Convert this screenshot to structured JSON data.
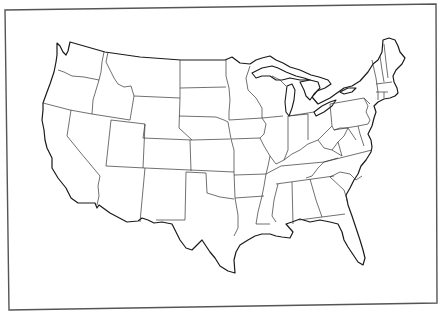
{
  "map": {
    "title": "Blank outline map of the contiguous United States",
    "style": "outline",
    "colors": {
      "background": "#ffffff",
      "outline": "#1a1a1a",
      "state_border": "#333333",
      "frame": "#555555"
    },
    "states": [
      "Washington",
      "Oregon",
      "California",
      "Idaho",
      "Nevada",
      "Montana",
      "Wyoming",
      "Utah",
      "Arizona",
      "Colorado",
      "New Mexico",
      "North Dakota",
      "South Dakota",
      "Nebraska",
      "Kansas",
      "Oklahoma",
      "Texas",
      "Minnesota",
      "Iowa",
      "Missouri",
      "Arkansas",
      "Louisiana",
      "Wisconsin",
      "Illinois",
      "Michigan",
      "Indiana",
      "Ohio",
      "Kentucky",
      "Tennessee",
      "Mississippi",
      "Alabama",
      "Georgia",
      "Florida",
      "South Carolina",
      "North Carolina",
      "Virginia",
      "West Virginia",
      "Maryland",
      "Delaware",
      "Pennsylvania",
      "New Jersey",
      "New York",
      "Connecticut",
      "Rhode Island",
      "Massachusetts",
      "Vermont",
      "New Hampshire",
      "Maine"
    ],
    "labels_visible": false
  }
}
